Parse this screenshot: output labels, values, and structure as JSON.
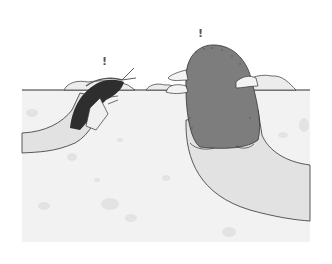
{
  "illustration": {
    "description": "Cartoon of a cricket-like insect and a mole both peeking out of burrows in the ground, each with an exclamation mark above",
    "characters": [
      {
        "name": "insect",
        "exclamation": "!"
      },
      {
        "name": "mole",
        "exclamation": "!"
      }
    ],
    "colors": {
      "background": "#ffffff",
      "soil": "#f1f1f1",
      "tunnel": "#e4e4e4",
      "mole_body": "#7d7d7d",
      "insect_body": "#2e2e2e",
      "outline": "#333333"
    }
  }
}
